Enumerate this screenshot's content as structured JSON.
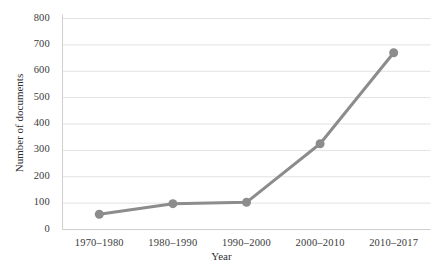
{
  "chart_data": {
    "type": "line",
    "title": "",
    "xlabel": "Year",
    "ylabel": "Number of documents",
    "categories": [
      "1970–1980",
      "1980–1990",
      "1990–2000",
      "2000–2010",
      "2010–2017"
    ],
    "series": [
      {
        "name": "Number of documents",
        "values": [
          58,
          98,
          103,
          325,
          670
        ]
      }
    ],
    "ylim": [
      0,
      800
    ],
    "yticks": [
      0,
      100,
      200,
      300,
      400,
      500,
      600,
      700,
      800
    ],
    "ytick_labels": [
      "0",
      "100",
      "200",
      "300",
      "400",
      "500",
      "600",
      "700",
      "800"
    ],
    "grid": "horizontal",
    "legend": "none",
    "colors": {
      "line": "#8c8c8c",
      "marker": "#8c8c8c",
      "grid": "#e2e2e2",
      "axis": "#cfcfcf",
      "text": "#333333",
      "background": "#ffffff"
    },
    "style": {
      "line_width": 3,
      "marker_size": 6,
      "marker_shape": "circle"
    }
  },
  "axes": {
    "x_title": "Year",
    "y_title": "Number of documents"
  }
}
